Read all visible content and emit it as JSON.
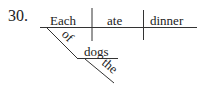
{
  "problem_number": "30.",
  "diagram": {
    "type": "sentence-diagram",
    "subject": "Each",
    "verb": "ate",
    "direct_object": "dinner",
    "modifiers": [
      {
        "preposition": "of",
        "object": "dogs",
        "modifies": "Each",
        "object_modifier": "the"
      }
    ]
  }
}
